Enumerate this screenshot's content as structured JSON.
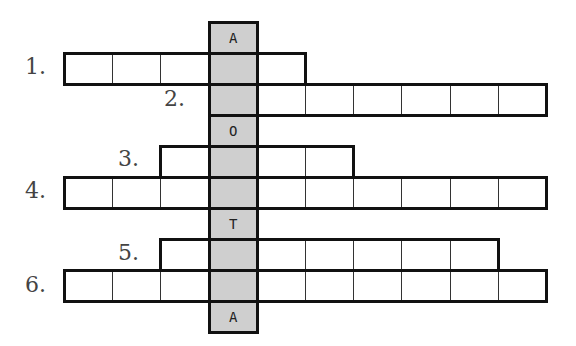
{
  "puzzle": {
    "type": "crossword",
    "grid": {
      "origin_x": 64,
      "origin_y": 22,
      "cell_w": 48.2,
      "cell_h": 31,
      "key_column": 3,
      "shade_color": "#cfcfcf"
    },
    "key_column_letters": [
      {
        "row": 0,
        "letter": "A"
      },
      {
        "row": 1,
        "letter": ""
      },
      {
        "row": 2,
        "letter": ""
      },
      {
        "row": 3,
        "letter": "O"
      },
      {
        "row": 4,
        "letter": ""
      },
      {
        "row": 5,
        "letter": ""
      },
      {
        "row": 6,
        "letter": "T"
      },
      {
        "row": 7,
        "letter": ""
      },
      {
        "row": 8,
        "letter": ""
      },
      {
        "row": 9,
        "letter": "A"
      }
    ],
    "words": [
      {
        "number": "1.",
        "row": 1,
        "start_col": 0,
        "length": 5,
        "label_x": 25,
        "label_y": 54
      },
      {
        "number": "2.",
        "row": 2,
        "start_col": 3,
        "length": 7,
        "label_x": 164,
        "label_y": 86
      },
      {
        "number": "3.",
        "row": 4,
        "start_col": 2,
        "length": 4,
        "label_x": 118,
        "label_y": 146
      },
      {
        "number": "4.",
        "row": 5,
        "start_col": 0,
        "length": 10,
        "label_x": 25,
        "label_y": 178
      },
      {
        "number": "5.",
        "row": 7,
        "start_col": 2,
        "length": 7,
        "label_x": 118,
        "label_y": 240
      },
      {
        "number": "6.",
        "row": 8,
        "start_col": 0,
        "length": 10,
        "label_x": 25,
        "label_y": 272
      }
    ]
  }
}
